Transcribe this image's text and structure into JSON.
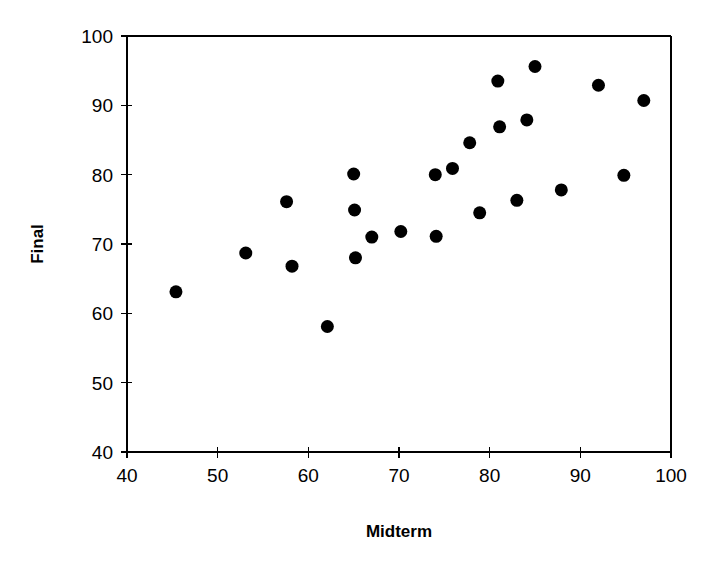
{
  "chart_data": {
    "type": "scatter",
    "title": "",
    "xlabel": "Midterm",
    "ylabel": "Final",
    "xlim": [
      40,
      100
    ],
    "ylim": [
      40,
      100
    ],
    "xticks": [
      40,
      50,
      60,
      70,
      80,
      90,
      100
    ],
    "yticks": [
      40,
      50,
      60,
      70,
      80,
      90,
      100
    ],
    "grid": false,
    "legend": null,
    "marker": "filled-circle",
    "marker_color": "#000000",
    "points": [
      {
        "x": 45.4,
        "y": 63.1
      },
      {
        "x": 53.1,
        "y": 68.7
      },
      {
        "x": 57.6,
        "y": 76.1
      },
      {
        "x": 58.2,
        "y": 66.8
      },
      {
        "x": 62.1,
        "y": 58.1
      },
      {
        "x": 65.0,
        "y": 80.1
      },
      {
        "x": 65.1,
        "y": 74.9
      },
      {
        "x": 65.2,
        "y": 68.0
      },
      {
        "x": 67.0,
        "y": 71.0
      },
      {
        "x": 70.2,
        "y": 71.8
      },
      {
        "x": 74.0,
        "y": 80.0
      },
      {
        "x": 74.1,
        "y": 71.1
      },
      {
        "x": 75.9,
        "y": 80.9
      },
      {
        "x": 77.8,
        "y": 84.6
      },
      {
        "x": 78.9,
        "y": 74.5
      },
      {
        "x": 80.9,
        "y": 93.5
      },
      {
        "x": 81.1,
        "y": 86.9
      },
      {
        "x": 83.0,
        "y": 76.3
      },
      {
        "x": 84.1,
        "y": 87.9
      },
      {
        "x": 85.0,
        "y": 95.6
      },
      {
        "x": 87.9,
        "y": 77.8
      },
      {
        "x": 92.0,
        "y": 92.9
      },
      {
        "x": 94.8,
        "y": 79.9
      },
      {
        "x": 97.0,
        "y": 90.7
      }
    ]
  },
  "axis": {
    "x_tick_labels": [
      "40",
      "50",
      "60",
      "70",
      "80",
      "90",
      "100"
    ],
    "y_tick_labels": [
      "40",
      "50",
      "60",
      "70",
      "80",
      "90",
      "100"
    ],
    "x_title": "Midterm",
    "y_title": "Final"
  },
  "colors": {
    "background": "#ffffff",
    "axis": "#000000",
    "marker": "#000000"
  }
}
